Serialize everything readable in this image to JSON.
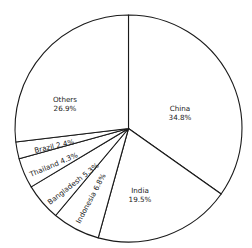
{
  "chart_data": {
    "type": "pie",
    "title": "",
    "start_angle_deg": 0,
    "direction": "clockwise",
    "slices": [
      {
        "label": "China",
        "value": 34.8,
        "display": "34.8%"
      },
      {
        "label": "India",
        "value": 19.5,
        "display": "19.5%"
      },
      {
        "label": "Indonesia",
        "value": 6.8,
        "display": "6.8%"
      },
      {
        "label": "Bangladesh",
        "value": 5.3,
        "display": "5.3%"
      },
      {
        "label": "Thailand",
        "value": 4.3,
        "display": "4.3%"
      },
      {
        "label": "Brazil",
        "value": 2.4,
        "display": "2.4%"
      },
      {
        "label": "Others",
        "value": 26.9,
        "display": "26.9%"
      }
    ],
    "legend": "none (labels inside slices)"
  },
  "labels": {
    "china": {
      "name": "China",
      "pct": "34.8%"
    },
    "india": {
      "name": "India",
      "pct": "19.5%"
    },
    "indonesia": "Indonesia  6.8%",
    "bangladesh": "Bangladesh  5.3%",
    "thailand": "Thailand  4.3%",
    "brazil": "Brazil  2.4%",
    "others": {
      "name": "Others",
      "pct": "26.9%"
    }
  }
}
